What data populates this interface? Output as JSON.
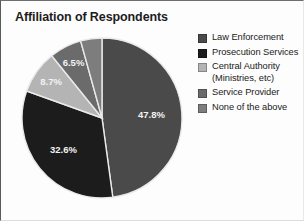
{
  "chart_data": {
    "type": "pie",
    "title": "Affiliation of Respondents",
    "xlabel": "",
    "ylabel": "",
    "grid": false,
    "legend_position": "right",
    "categories": [
      "Law Enforcement",
      "Prosecution Services",
      "Central Authority (Ministries, etc)",
      "Service Provider",
      "None of the above"
    ],
    "values": [
      47.8,
      32.6,
      8.7,
      6.5,
      4.3
    ],
    "value_unit": "%",
    "slice_labels": [
      "47.8%",
      "32.6%",
      "8.7%",
      "6.5%",
      ""
    ],
    "colors": [
      "#4a4a4a",
      "#1c1c1c",
      "#b4b4b4",
      "#6b6b6b",
      "#7d7d7d"
    ],
    "slice_label_color": "#f2f2f2",
    "separator_color": "#e9e9e9",
    "start_angle_deg": -90,
    "direction": "clockwise"
  },
  "legend": {
    "items": [
      {
        "label": "Law Enforcement",
        "color": "#4a4a4a"
      },
      {
        "label": "Prosecution Services",
        "color": "#1c1c1c"
      },
      {
        "label": "Central Authority (Ministries, etc)",
        "color": "#b4b4b4"
      },
      {
        "label": "Service Provider",
        "color": "#6b6b6b"
      },
      {
        "label": "None of the above",
        "color": "#7d7d7d"
      }
    ]
  }
}
